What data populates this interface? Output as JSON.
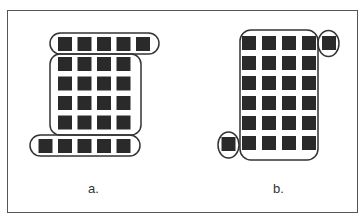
{
  "diagram": {
    "colors": {
      "square": "#2a2a2a",
      "outline": "#333333",
      "frame": "#555555"
    },
    "panels": [
      {
        "id": "a",
        "label": "a.",
        "description": "Grouping by proximity: top row of 5, 4x4 block, bottom row of 5",
        "groups": [
          {
            "name": "top-row",
            "shape": "pill",
            "count": 5
          },
          {
            "name": "middle-block",
            "shape": "rounded-rect",
            "rows": 4,
            "cols": 4
          },
          {
            "name": "bottom-row",
            "shape": "pill",
            "count": 5
          }
        ]
      },
      {
        "id": "b",
        "label": "b.",
        "description": "6x4 block with two outlying squares circled",
        "groups": [
          {
            "name": "main-block",
            "shape": "rounded-rect",
            "rows": 6,
            "cols": 4
          },
          {
            "name": "top-right-single",
            "shape": "circle",
            "count": 1
          },
          {
            "name": "bottom-left-single",
            "shape": "circle",
            "count": 1
          }
        ]
      }
    ]
  }
}
